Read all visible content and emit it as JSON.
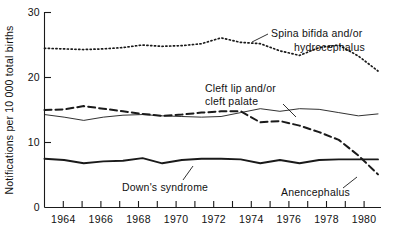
{
  "chart_data": {
    "type": "line",
    "title": "",
    "subtitle": "",
    "xlabel": "",
    "ylabel": "Notifications per 10 000 total births",
    "xlim": [
      1963,
      1980
    ],
    "ylim": [
      0,
      30
    ],
    "xticks": [
      1963,
      1964,
      1965,
      1966,
      1967,
      1968,
      1969,
      1970,
      1971,
      1972,
      1973,
      1974,
      1975,
      1976,
      1977,
      1978,
      1979,
      1980
    ],
    "xticklabels": [
      "",
      "1964",
      "",
      "1966",
      "",
      "1968",
      "",
      "1970",
      "",
      "1972",
      "",
      "1974",
      "",
      "1976",
      "",
      "1978",
      "",
      "1980"
    ],
    "yticks": [
      0,
      10,
      20,
      30
    ],
    "yticklabels": [
      "0",
      "10",
      "20",
      "30"
    ],
    "grid": false,
    "legend_position": "inline-annotations",
    "x": [
      1963,
      1964,
      1965,
      1966,
      1967,
      1968,
      1969,
      1970,
      1971,
      1972,
      1973,
      1974,
      1975,
      1976,
      1977,
      1978,
      1979,
      1980
    ],
    "series": [
      {
        "name": "Spina bifida and/or hydrocephalus",
        "style": "dotted",
        "values": [
          24.5,
          24.4,
          24.3,
          24.4,
          24.6,
          25.0,
          24.8,
          24.9,
          25.2,
          26.1,
          25.4,
          25.2,
          24.1,
          23.4,
          24.6,
          25.0,
          23.3,
          21.0
        ]
      },
      {
        "name": "Anencephalus",
        "style": "dashed",
        "values": [
          15.0,
          15.1,
          15.6,
          15.2,
          14.8,
          14.4,
          14.1,
          14.3,
          14.6,
          14.8,
          14.8,
          13.1,
          13.3,
          12.6,
          11.6,
          10.4,
          8.0,
          5.1
        ]
      },
      {
        "name": "Cleft lip and/or cleft palate",
        "style": "thin-solid",
        "values": [
          14.3,
          13.9,
          13.4,
          13.9,
          14.2,
          14.3,
          14.1,
          14.0,
          13.9,
          14.0,
          14.6,
          15.2,
          14.8,
          15.2,
          15.1,
          14.6,
          14.1,
          14.4
        ]
      },
      {
        "name": "Down's syndrome",
        "style": "thick-solid",
        "values": [
          7.5,
          7.3,
          6.8,
          7.1,
          7.2,
          7.6,
          6.8,
          7.3,
          7.5,
          7.5,
          7.4,
          6.8,
          7.3,
          6.8,
          7.3,
          7.4,
          7.4,
          7.4
        ]
      }
    ],
    "annotations": [
      {
        "id": "spina-bifida",
        "text_line1": "Spina bifida and/or",
        "text_line2": "hydrocephalus"
      },
      {
        "id": "cleft-lip",
        "text_line1": "Cleft lip and/or",
        "text_line2": "cleft palate"
      },
      {
        "id": "downs-syndrome",
        "text_line1": "Down's syndrome",
        "text_line2": ""
      },
      {
        "id": "anencephalus",
        "text_line1": "Anencephalus",
        "text_line2": ""
      }
    ]
  }
}
